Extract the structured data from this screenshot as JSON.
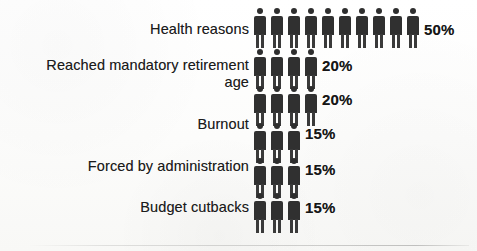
{
  "chart_data": {
    "type": "bar",
    "subtype": "pictogram",
    "title": "",
    "xlabel": "",
    "ylabel": "",
    "unit": "%",
    "icon": "person-icon",
    "icon_value": 5,
    "categories": [
      "Health reasons",
      "Reached mandatory retirement age",
      "Burnout",
      "Forced by administration",
      "Budget cutbacks"
    ],
    "values": [
      50,
      20,
      20,
      15,
      15
    ],
    "value_labels": [
      "50%",
      "20%",
      "20%",
      "15%",
      "15%"
    ],
    "icon_counts": [
      10,
      4,
      4,
      3,
      3
    ],
    "legend": [],
    "grid": false
  },
  "rows": [
    {
      "label": "Health reasons",
      "value_label": "50%",
      "icons": 10,
      "label_top": 21,
      "label_right": 228,
      "strip_top": 8,
      "value_left": 424,
      "value_top": 21
    },
    {
      "label": "Reached mandatory retirement\nage",
      "value_label": "20%",
      "icons": 4,
      "label_top": 57,
      "label_right": 228,
      "strip_top": 49,
      "value_left": 322,
      "value_top": 57
    },
    {
      "label": "Burnout",
      "value_label": "20%",
      "icons": 4,
      "label_top": 116,
      "label_right": 228,
      "strip_top": 86,
      "value_left": 322,
      "value_top": 91
    },
    {
      "label": "Forced by administration",
      "value_label": "15%",
      "icons": 3,
      "label_top": 158,
      "label_right": 228,
      "strip_top": 123,
      "value_left": 305,
      "value_top": 125
    },
    {
      "label": "Budget cutbacks",
      "value_label": "15%",
      "icons": 3,
      "label_top": 199,
      "label_right": 228,
      "strip_top": 158,
      "value_left": 305,
      "value_top": 161
    },
    {
      "label": "",
      "value_label": "15%",
      "icons": 3,
      "label_top": 0,
      "label_right": 228,
      "strip_top": 193,
      "value_left": 305,
      "value_top": 199
    }
  ],
  "colors": {
    "figure": "#303030",
    "text": "#1c1c1c",
    "value_text": "#161616",
    "background": "#fdfdfc"
  }
}
